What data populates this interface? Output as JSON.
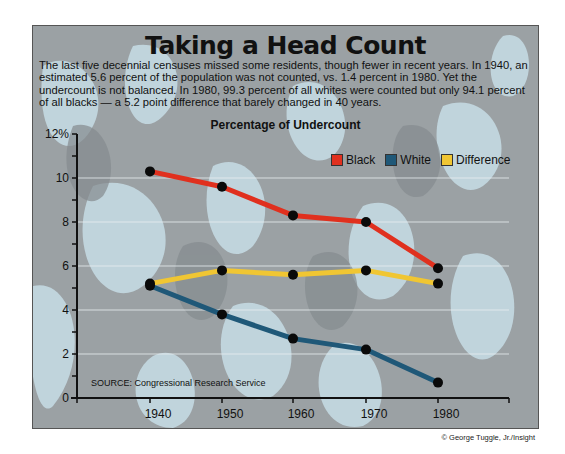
{
  "header": {
    "title": "Taking a Head Count",
    "description": "The last five decennial censuses missed some residents, though fewer in recent years. In 1940, an estimated 5.6 percent of the population was not counted, vs. 1.4 percent in 1980. Yet the undercount is not balanced. In 1980, 99.3 percent of all whites were counted but only 94.1 percent of all blacks — a 5.2 point difference that barely changed in 40 years.",
    "chart_title": "Percentage of Undercount"
  },
  "legend": [
    {
      "label": "Black",
      "color": "#e0301e"
    },
    {
      "label": "White",
      "color": "#1f5878"
    },
    {
      "label": "Difference",
      "color": "#f0c633"
    }
  ],
  "source": "SOURCE: Congressional Research Service",
  "credit": "© George Tuggle, Jr./Insight",
  "y_tick_labels": [
    "0",
    "2",
    "4",
    "6",
    "8",
    "10",
    "12%"
  ],
  "x_tick_labels": [
    "1940",
    "1950",
    "1960",
    "1970",
    "1980"
  ],
  "chart_data": {
    "type": "line",
    "title": "Percentage of Undercount",
    "xlabel": "",
    "ylabel": "Percent",
    "x": [
      1940,
      1950,
      1960,
      1970,
      1980
    ],
    "series": [
      {
        "name": "Black",
        "color": "#e0301e",
        "values": [
          10.3,
          9.6,
          8.3,
          8.0,
          5.9
        ]
      },
      {
        "name": "White",
        "color": "#1f5878",
        "values": [
          5.1,
          3.8,
          2.7,
          2.2,
          0.7
        ]
      },
      {
        "name": "Difference",
        "color": "#f0c633",
        "values": [
          5.2,
          5.8,
          5.6,
          5.8,
          5.2
        ]
      }
    ],
    "ylim": [
      0,
      12
    ],
    "yticks_major": [
      0,
      2,
      4,
      6,
      8,
      10,
      12
    ],
    "grid": true,
    "legend_position": "top-right"
  }
}
